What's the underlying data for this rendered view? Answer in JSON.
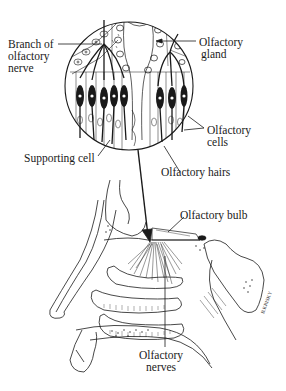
{
  "figure": {
    "ink_color": "#1a1a1a",
    "background": "#ffffff"
  },
  "labels": {
    "branch_of_olfactory_nerve": {
      "line1": "Branch of",
      "line2": "olfactory",
      "line3": "nerve"
    },
    "olfactory_gland": {
      "line1": "Olfactory",
      "line2": "gland"
    },
    "olfactory_cells": {
      "line1": "Olfactory",
      "line2": "cells"
    },
    "supporting_cell": "Supporting cell",
    "olfactory_hairs": "Olfactory hairs",
    "olfactory_bulb": "Olfactory bulb",
    "olfactory_nerves": {
      "line1": "Olfactory",
      "line2": "nerves"
    }
  },
  "signature": "B.KRISKY"
}
